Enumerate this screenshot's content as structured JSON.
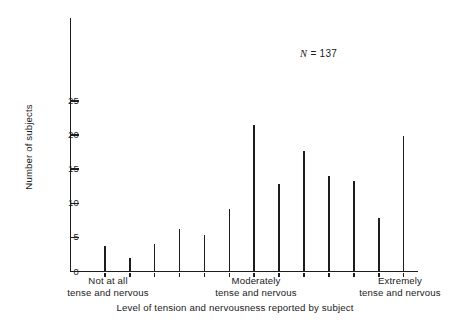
{
  "chart_data": {
    "type": "bar",
    "title": "",
    "subtitle": "",
    "xlabel": "Level of tension and nervousness reported by subject",
    "ylabel": "Number of subjects",
    "annotation": "N = 137",
    "annotation_symbol": "N",
    "annotation_rest": " = 137",
    "grid": false,
    "legend": false,
    "ylim": [
      0,
      30
    ],
    "ytick_labels": [
      "0",
      "5",
      "10",
      "15",
      "20",
      "25"
    ],
    "ytick_values": [
      0,
      5,
      10,
      15,
      20,
      25
    ],
    "xtick_group_labels": [
      {
        "line1": "Not at all",
        "line2": "tense and nervous"
      },
      {
        "line1": "Moderately",
        "line2": "tense and nervous"
      },
      {
        "line1": "Extremely",
        "line2": "tense and nervous"
      }
    ],
    "categories": [
      "1",
      "2",
      "3",
      "4",
      "5",
      "6",
      "7",
      "8",
      "9",
      "10",
      "11",
      "12",
      "13"
    ],
    "values": [
      3.7,
      2.0,
      4.0,
      6.3,
      5.4,
      9.1,
      21.5,
      12.9,
      17.6,
      14.0,
      13.2,
      7.9,
      19.9
    ],
    "total_n": 137,
    "colors": {
      "bar": "#1d1d1d",
      "axis": "#1d1d1d",
      "background": "#ffffff"
    }
  }
}
